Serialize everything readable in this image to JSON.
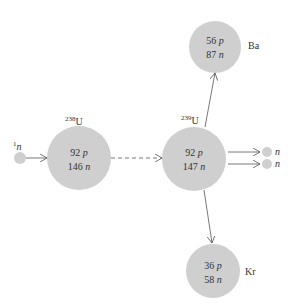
{
  "diagram": {
    "colors": {
      "nucleus": "#cfcfcf",
      "arrow": "#555555",
      "text": "#333333"
    },
    "incoming_neutron": {
      "mass": "1",
      "symbol": "n"
    },
    "u238": {
      "mass": "238",
      "symbol": "U",
      "protons": "92",
      "neutrons": "146",
      "p": "p",
      "n": "n"
    },
    "u239": {
      "mass": "239",
      "symbol": "U",
      "protons": "92",
      "neutrons": "147",
      "p": "p",
      "n": "n"
    },
    "ba": {
      "symbol": "Ba",
      "protons": "56",
      "neutrons": "87",
      "p": "p",
      "n": "n"
    },
    "kr": {
      "symbol": "Kr",
      "protons": "36",
      "neutrons": "58",
      "p": "p",
      "n": "n"
    },
    "emitted_neutrons": [
      {
        "symbol": "n"
      },
      {
        "symbol": "n"
      }
    ]
  }
}
